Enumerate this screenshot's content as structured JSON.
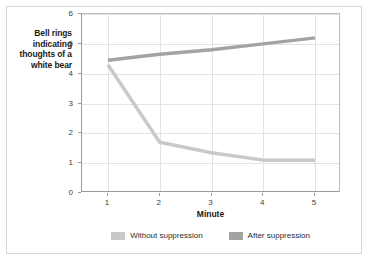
{
  "figure": {
    "background_color": "#ffffff",
    "border_color": "#d6d6d6"
  },
  "chart_data": {
    "type": "line",
    "title": "",
    "xlabel": "Minute",
    "ylabel": "Bell rings indicating thoughts of a white bear",
    "x": [
      1,
      2,
      3,
      4,
      5
    ],
    "xtick_labels": [
      "1",
      "2",
      "3",
      "4",
      "5"
    ],
    "ytick_labels": [
      "0",
      "1",
      "2",
      "3",
      "4",
      "5",
      "6"
    ],
    "xlim": [
      0.5,
      5.5
    ],
    "ylim": [
      0,
      6
    ],
    "grid": "both",
    "legend_position": "bottom-center",
    "series": [
      {
        "name": "Without suppression",
        "color": "#c9c9c9",
        "values": [
          4.3,
          1.7,
          1.35,
          1.1,
          1.1
        ]
      },
      {
        "name": "After suppression",
        "color": "#a3a3a3",
        "values": [
          4.45,
          4.65,
          4.8,
          5.0,
          5.2
        ]
      }
    ]
  },
  "axes": {
    "y_title": "Bell rings indicating thoughts of a white bear",
    "x_title": "Minute"
  },
  "legend": {
    "entries": [
      {
        "label": "Without suppression",
        "color": "#c9c9c9"
      },
      {
        "label": "After suppression",
        "color": "#a3a3a3"
      }
    ]
  }
}
